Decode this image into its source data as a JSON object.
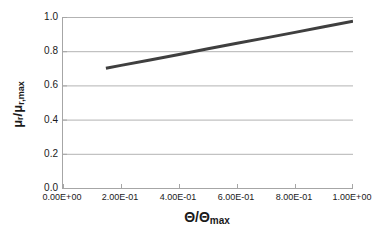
{
  "chart_data": {
    "type": "line",
    "title": "",
    "subtitle": "",
    "xlabel_plain": "Theta/Theta_max",
    "ylabel_plain": "mu_r/mu_r,max",
    "xlabel_parts": {
      "main": "Θ/Θ",
      "sub": "max"
    },
    "ylabel_parts": {
      "main": "μᵣ/μ",
      "sub": "r,max"
    },
    "xlim": [
      0.0,
      1.0
    ],
    "ylim": [
      0.0,
      1.0
    ],
    "xticks": [
      0.0,
      0.2,
      0.4,
      0.6,
      0.8,
      1.0
    ],
    "yticks": [
      0.0,
      0.2,
      0.4,
      0.6,
      0.8,
      1.0
    ],
    "xticklabels": [
      "0.00E+00",
      "2.00E-01",
      "4.00E-01",
      "6.00E-01",
      "8.00E-01",
      "1.00E+00"
    ],
    "yticklabels": [
      "0.0",
      "0.2",
      "0.4",
      "0.6",
      "0.8",
      "1.0"
    ],
    "grid": {
      "horizontal": true,
      "vertical": false,
      "color": "#b3b3b3"
    },
    "legend": {
      "visible": false,
      "position": "none"
    },
    "series": [
      {
        "name": "mu_r/mu_r,max",
        "color": "#3f3f3f",
        "linewidth": 3,
        "marker": "none",
        "x": [
          0.148,
          0.2,
          0.3,
          0.4,
          0.5,
          0.6,
          0.7,
          0.8,
          0.9,
          1.0
        ],
        "y": [
          0.7,
          0.717,
          0.749,
          0.781,
          0.814,
          0.846,
          0.878,
          0.91,
          0.943,
          0.975
        ]
      }
    ],
    "annotations": []
  },
  "axes": {
    "axis_color": "#a6a6a6",
    "tick_color": "#a6a6a6",
    "background": "#ffffff"
  },
  "figure": {
    "background": "#ffffff",
    "width": 387,
    "height": 243
  }
}
